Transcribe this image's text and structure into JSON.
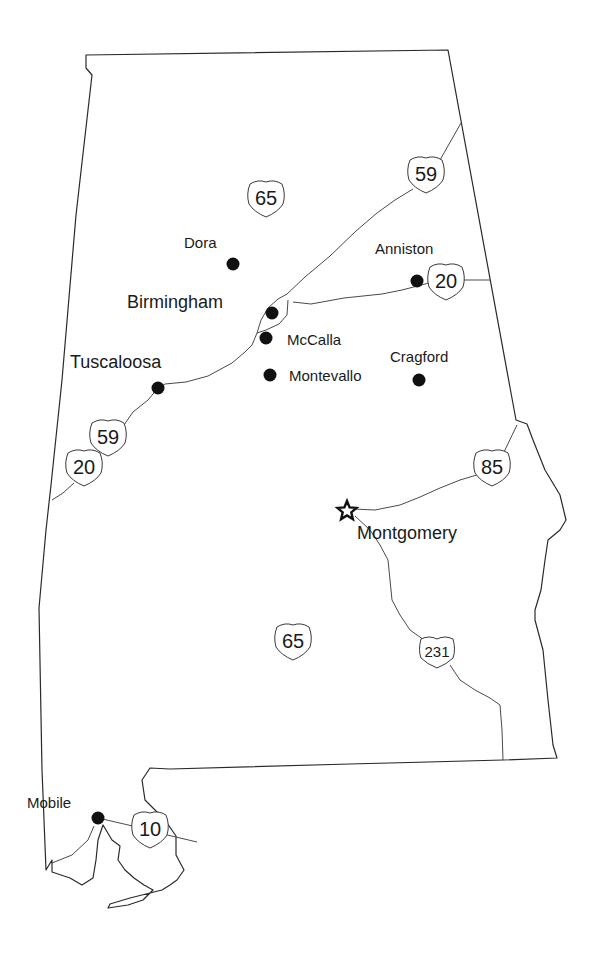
{
  "map": {
    "region": "Alabama",
    "colors": {
      "border": "#2a2a2a",
      "road": "#4a4a4a",
      "dot": "#111111",
      "background": "#ffffff"
    }
  },
  "cities": [
    {
      "name": "Dora",
      "x": 233,
      "y": 264,
      "lx": 184,
      "ly": 248,
      "size": "small"
    },
    {
      "name": "Anniston",
      "x": 417,
      "y": 281,
      "lx": 375,
      "ly": 254,
      "size": "small"
    },
    {
      "name": "Birmingham",
      "x": 272,
      "y": 313,
      "lx": 127,
      "ly": 308,
      "size": "large"
    },
    {
      "name": "McCalla",
      "x": 266,
      "y": 338,
      "lx": 287,
      "ly": 345,
      "size": "small"
    },
    {
      "name": "Tuscaloosa",
      "x": 158,
      "y": 388,
      "lx": 70,
      "ly": 368,
      "size": "large"
    },
    {
      "name": "Montevallo",
      "x": 270,
      "y": 375,
      "lx": 289,
      "ly": 381,
      "size": "small"
    },
    {
      "name": "Cragford",
      "x": 419,
      "y": 380,
      "lx": 390,
      "ly": 362,
      "size": "small"
    },
    {
      "name": "Mobile",
      "x": 98,
      "y": 818,
      "lx": 27,
      "ly": 808,
      "size": "small"
    }
  ],
  "capital": {
    "name": "Montgomery",
    "x": 347,
    "y": 511,
    "lx": 357,
    "ly": 539
  },
  "shields": [
    {
      "type": "interstate",
      "number": "65",
      "x": 266,
      "y": 198
    },
    {
      "type": "interstate",
      "number": "59",
      "x": 426,
      "y": 174
    },
    {
      "type": "interstate",
      "number": "20",
      "x": 446,
      "y": 281
    },
    {
      "type": "interstate",
      "number": "59",
      "x": 108,
      "y": 437
    },
    {
      "type": "interstate",
      "number": "20",
      "x": 84,
      "y": 467
    },
    {
      "type": "interstate",
      "number": "85",
      "x": 492,
      "y": 467
    },
    {
      "type": "interstate",
      "number": "65",
      "x": 293,
      "y": 641
    },
    {
      "type": "us",
      "number": "231",
      "x": 437,
      "y": 652
    },
    {
      "type": "interstate",
      "number": "10",
      "x": 150,
      "y": 829
    }
  ]
}
